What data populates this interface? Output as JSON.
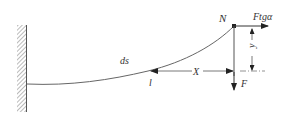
{
  "diagram": {
    "type": "cantilever beam deflection",
    "labels": {
      "node": "N",
      "horizontal_force": "Ftgα",
      "vertical_force": "F",
      "arc_element": "ds",
      "point": "l",
      "horizontal_distance": "X",
      "vertical_distance": "y"
    },
    "colors": {
      "line": "#555555",
      "text": "#333333",
      "background": "#ffffff"
    }
  }
}
